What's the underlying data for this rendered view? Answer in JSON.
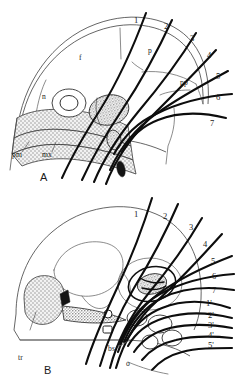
{
  "figure": {
    "background_color": "#ffffff",
    "ink_color": "#111111",
    "accent_shade": "#a8a8a8"
  },
  "panels": [
    {
      "id": "A",
      "label": "A",
      "numbered_lines": [
        {
          "label": "1",
          "x": 134,
          "y": 23
        },
        {
          "label": "2",
          "x": 164,
          "y": 29
        },
        {
          "label": "3",
          "x": 190,
          "y": 41
        },
        {
          "label": "4",
          "x": 207,
          "y": 58
        },
        {
          "label": "5",
          "x": 216,
          "y": 79
        },
        {
          "label": "6",
          "x": 216,
          "y": 100
        },
        {
          "label": "7",
          "x": 210,
          "y": 126
        }
      ],
      "bone_labels": [
        {
          "label": "f",
          "x": 79,
          "y": 60
        },
        {
          "label": "n",
          "x": 42,
          "y": 99
        },
        {
          "label": "p",
          "x": 148,
          "y": 53
        },
        {
          "label": "pp",
          "x": 182,
          "y": 85
        },
        {
          "label": "pm",
          "x": 14,
          "y": 156
        },
        {
          "label": "mx",
          "x": 44,
          "y": 156
        }
      ]
    },
    {
      "id": "B",
      "label": "B",
      "numbered_lines": [
        {
          "label": "1",
          "x": 136,
          "y": 215
        },
        {
          "label": "2",
          "x": 164,
          "y": 217
        },
        {
          "label": "3",
          "x": 190,
          "y": 228
        },
        {
          "label": "4",
          "x": 203,
          "y": 246
        },
        {
          "label": "5",
          "x": 211,
          "y": 264
        },
        {
          "label": "6",
          "x": 212,
          "y": 278
        },
        {
          "label": "7",
          "x": 212,
          "y": 292
        }
      ],
      "primed_lines": [
        {
          "label": "1'",
          "x": 207,
          "y": 304
        },
        {
          "label": "2'",
          "x": 209,
          "y": 317
        },
        {
          "label": "3'",
          "x": 209,
          "y": 327
        },
        {
          "label": "4'",
          "x": 209,
          "y": 337
        },
        {
          "label": "5'",
          "x": 209,
          "y": 347
        }
      ],
      "bone_labels": [
        {
          "label": "tr",
          "x": 20,
          "y": 358
        },
        {
          "label": "bs",
          "x": 111,
          "y": 350
        },
        {
          "label": "o",
          "x": 128,
          "y": 365
        }
      ]
    }
  ],
  "legend_keys": {
    "pm": "premaxilla",
    "mx": "maxilla",
    "n": "nasal",
    "f": "frontal",
    "p": "parietal",
    "pp": "postparietal",
    "tr": "tabular-row",
    "bs": "basisphenoid",
    "o": "orbital-foramen"
  }
}
